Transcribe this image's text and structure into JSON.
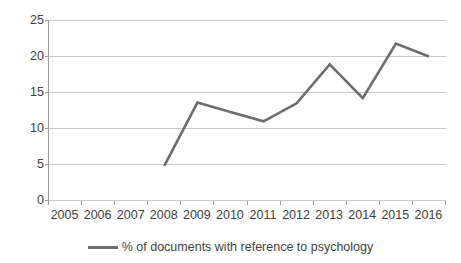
{
  "chart_data": {
    "type": "line",
    "title": "",
    "subtitle": "",
    "xlabel": "",
    "ylabel": "",
    "categories": [
      "2005",
      "2006",
      "2007",
      "2008",
      "2009",
      "2010",
      "2011",
      "2012",
      "2013",
      "2014",
      "2015",
      "2016"
    ],
    "series": [
      {
        "name": "% of documents with reference to psychology",
        "color": "#6d6d6d",
        "values": [
          null,
          null,
          null,
          4.8,
          13.6,
          12.3,
          11.0,
          13.5,
          18.9,
          14.2,
          21.8,
          20.0
        ]
      }
    ],
    "ylim": [
      0,
      25
    ],
    "yticks": [
      0,
      5,
      10,
      15,
      20,
      25
    ],
    "ytick_labels": [
      "0",
      "5",
      "10",
      "15",
      "20",
      "25"
    ],
    "grid": "horizontal",
    "legend_position": "bottom",
    "annotations": []
  },
  "legend": {
    "items": [
      {
        "label": "% of documents with reference to psychology",
        "color": "#6d6d6d"
      }
    ]
  },
  "colors": {
    "line": "#6d6d6d",
    "grid": "#c9c9c9",
    "axis": "#9a9a9a",
    "text": "#3f3f3f",
    "background": "#ffffff"
  }
}
